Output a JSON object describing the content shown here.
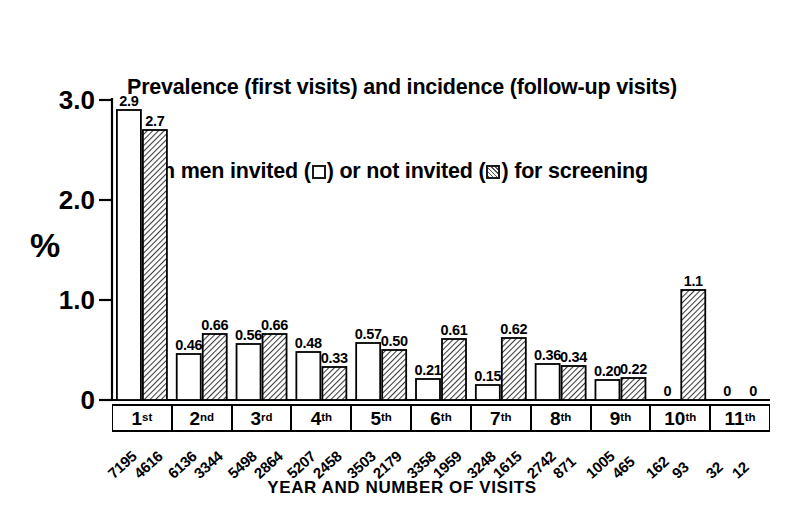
{
  "chart_data": {
    "type": "bar",
    "title_line1": "Prevalence (first visits) and incidence (follow-up visits)",
    "title_line2_a": "in men invited (",
    "title_line2_b": ") or not invited (",
    "title_line2_c": ") for screening",
    "xlabel": "YEAR AND NUMBER OF VISITS",
    "ylabel": "%",
    "ylim": [
      0,
      3.0
    ],
    "yticks": [
      "0",
      "1.0",
      "2.0",
      "3.0"
    ],
    "ytick_values": [
      0,
      1.0,
      2.0,
      3.0
    ],
    "grid": false,
    "legend_position": "title",
    "categories": [
      "1st",
      "2nd",
      "3rd",
      "4th",
      "5th",
      "6th",
      "7th",
      "8th",
      "9th",
      "10th",
      "11th"
    ],
    "category_ordinals": [
      {
        "num": "1",
        "suffix": "st"
      },
      {
        "num": "2",
        "suffix": "nd"
      },
      {
        "num": "3",
        "suffix": "rd"
      },
      {
        "num": "4",
        "suffix": "th"
      },
      {
        "num": "5",
        "suffix": "th"
      },
      {
        "num": "6",
        "suffix": "th"
      },
      {
        "num": "7",
        "suffix": "th"
      },
      {
        "num": "8",
        "suffix": "th"
      },
      {
        "num": "9",
        "suffix": "th"
      },
      {
        "num": "10",
        "suffix": "th"
      },
      {
        "num": "11",
        "suffix": "th"
      }
    ],
    "series": [
      {
        "name": "invited",
        "style": "open",
        "values": [
          2.9,
          0.46,
          0.56,
          0.48,
          0.57,
          0.21,
          0.15,
          0.36,
          0.2,
          0,
          0
        ],
        "labels": [
          "2.9",
          "0.46",
          "0.56",
          "0.48",
          "0.57",
          "0.21",
          "0.15",
          "0.36",
          "0.20",
          "0",
          "0"
        ],
        "counts": [
          "7195",
          "6136",
          "5498",
          "5207",
          "3503",
          "3358",
          "3248",
          "2742",
          "1005",
          "162",
          "32"
        ]
      },
      {
        "name": "not invited",
        "style": "hatched",
        "values": [
          2.7,
          0.66,
          0.66,
          0.33,
          0.5,
          0.61,
          0.62,
          0.34,
          0.22,
          1.1,
          0
        ],
        "labels": [
          "2.7",
          "0.66",
          "0.66",
          "0.33",
          "0.50",
          "0.61",
          "0.62",
          "0.34",
          "0.22",
          "1.1",
          "0"
        ],
        "counts": [
          "4616",
          "3344",
          "2864",
          "2458",
          "2179",
          "1959",
          "1615",
          "871",
          "465",
          "93",
          "12"
        ]
      }
    ],
    "colors": {
      "axis": "#000000",
      "open_bar_fill": "#ffffff",
      "open_bar_stroke": "#000000",
      "hatched_bar_fill": "#e8e8e8",
      "hatched_bar_stroke": "#000000",
      "text": "#000000",
      "background": "#ffffff"
    }
  }
}
